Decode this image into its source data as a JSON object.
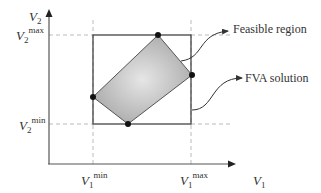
{
  "diagram": {
    "y_axis_label": "V",
    "y_axis_sub": "2",
    "x_axis_label": "V",
    "x_axis_sub": "1",
    "v2max": {
      "base": "V",
      "sub": "2",
      "sup": "max"
    },
    "v2min": {
      "base": "V",
      "sub": "2",
      "sup": "min"
    },
    "v1min": {
      "base": "V",
      "sub": "1",
      "sup": "min"
    },
    "v1max": {
      "base": "V",
      "sub": "1",
      "sup": "max"
    },
    "annotations": {
      "feasible_region": "Feasible region",
      "fva_solution": "FVA solution"
    },
    "colors": {
      "axis": "#555555",
      "box": "#444444",
      "region_fill_center": "#e4e4e4",
      "region_fill_edge": "#a8a8a8",
      "dashed": "#bbbbbb",
      "point": "#111111"
    }
  }
}
